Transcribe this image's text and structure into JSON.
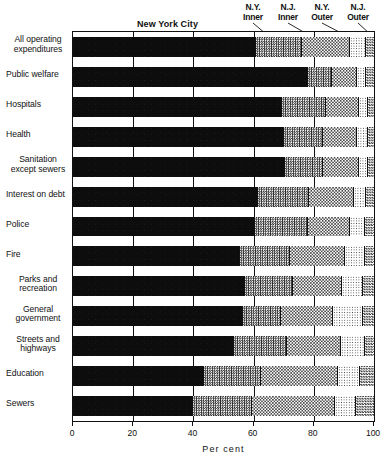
{
  "chart_data": {
    "type": "bar",
    "subtype": "horizontal-stacked-100-percent",
    "title": "",
    "xlabel": "Per cent",
    "ylabel": "",
    "xlim": [
      0,
      100
    ],
    "xticks": [
      0,
      20,
      40,
      60,
      80,
      100
    ],
    "xticklabels": [
      "0",
      "20",
      "40",
      "60",
      "80",
      "100"
    ],
    "grid": true,
    "grid_axis": "x",
    "legend_position": "top-callouts",
    "series_inline_label": "New York City",
    "categories": [
      "All operating expenditures",
      "Public welfare",
      "Hospitals",
      "Health",
      "Sanitation except sewers",
      "Interest on debt",
      "Police",
      "Fire",
      "Parks and recreation",
      "General government",
      "Streets and highways",
      "Education",
      "Sewers"
    ],
    "series": [
      {
        "name": "New York City",
        "pattern": "solid-black",
        "color": "#0d0d0d",
        "values": [
          60.8,
          78.0,
          69.5,
          70.0,
          70.5,
          61.5,
          60.5,
          55.5,
          57.0,
          56.5,
          53.5,
          43.5,
          40.0
        ]
      },
      {
        "name": "N.Y. Inner",
        "pattern": "dense-checker",
        "color": "#2a2a2a",
        "values": [
          15.2,
          8.0,
          14.5,
          13.0,
          12.5,
          17.0,
          17.5,
          16.5,
          16.0,
          12.5,
          17.5,
          19.0,
          19.5
        ]
      },
      {
        "name": "N.J. Inner",
        "pattern": "medium-checker",
        "color": "#4a4a4a",
        "values": [
          16.0,
          8.5,
          11.0,
          11.5,
          12.0,
          15.0,
          14.0,
          18.5,
          16.5,
          17.5,
          18.0,
          25.5,
          27.5
        ]
      },
      {
        "name": "N.Y. Outer",
        "pattern": "fine-dots",
        "color": "#3a3a3a",
        "values": [
          5.5,
          3.0,
          3.0,
          3.5,
          3.0,
          4.0,
          5.0,
          6.5,
          7.0,
          10.0,
          8.0,
          7.5,
          7.0
        ]
      },
      {
        "name": "N.J. Outer",
        "pattern": "checker",
        "color": "#3c3c3c",
        "values": [
          2.5,
          2.5,
          2.0,
          2.0,
          2.0,
          2.5,
          3.0,
          3.0,
          3.5,
          3.5,
          3.0,
          4.5,
          6.0
        ]
      }
    ]
  },
  "callouts": [
    {
      "label": "N.Y.\nInner"
    },
    {
      "label": "N.J.\nInner"
    },
    {
      "label": "N.Y.\nOuter"
    },
    {
      "label": "N.J.\nOuter"
    }
  ]
}
